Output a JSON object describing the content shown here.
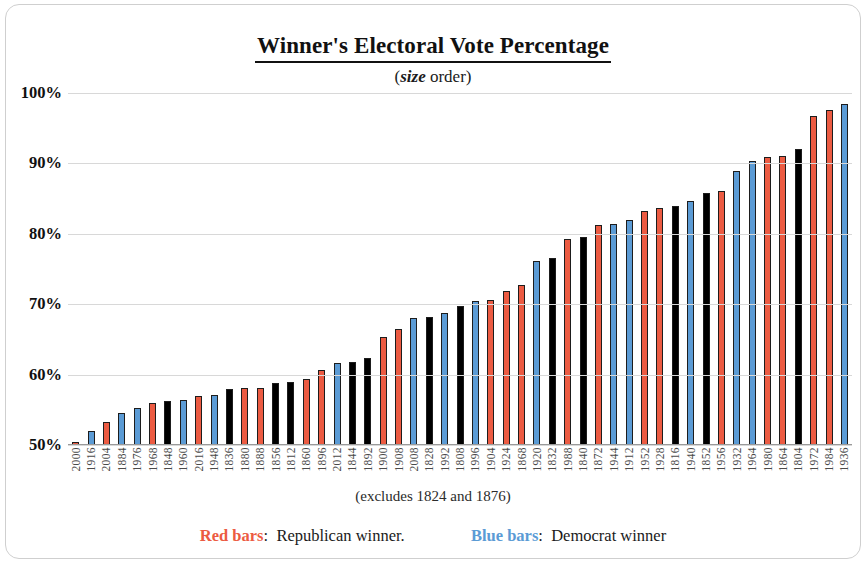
{
  "chart_data": {
    "type": "bar",
    "title": "Winner's Electoral Vote Percentage",
    "subtitle_emphasis": "size",
    "subtitle_prefix": "(",
    "subtitle_suffix": " order)",
    "footnote": "(excludes 1824 and 1876)",
    "xlabel": "",
    "ylabel": "",
    "ylim": [
      50,
      100
    ],
    "yticks": [
      "50%",
      "60%",
      "70%",
      "80%",
      "90%",
      "100%"
    ],
    "ytick_values": [
      50,
      60,
      70,
      80,
      90,
      100
    ],
    "grid": true,
    "legend_position": "bottom",
    "categories": [
      "2000",
      "1916",
      "2004",
      "1884",
      "1976",
      "1968",
      "1848",
      "1960",
      "2016",
      "1948",
      "1836",
      "1880",
      "1888",
      "1856",
      "1812",
      "1860",
      "1896",
      "2012",
      "1844",
      "1892",
      "1900",
      "1908",
      "2008",
      "1828",
      "1992",
      "1808",
      "1996",
      "1904",
      "1924",
      "1868",
      "1920",
      "1832",
      "1988",
      "1840",
      "1872",
      "1944",
      "1912",
      "1952",
      "1928",
      "1816",
      "1940",
      "1852",
      "1956",
      "1932",
      "1964",
      "1980",
      "1864",
      "1804",
      "1972",
      "1984",
      "1936"
    ],
    "values": [
      50.4,
      52.0,
      53.2,
      54.6,
      55.2,
      55.9,
      56.2,
      56.4,
      56.9,
      57.1,
      58.0,
      58.1,
      58.1,
      58.8,
      59.0,
      59.4,
      60.6,
      61.7,
      61.8,
      62.4,
      65.3,
      66.5,
      68.0,
      68.2,
      68.8,
      69.7,
      70.4,
      70.6,
      71.9,
      72.8,
      76.1,
      76.6,
      79.2,
      79.6,
      81.3,
      81.4,
      81.9,
      83.2,
      83.6,
      84.0,
      84.6,
      85.8,
      86.1,
      88.9,
      90.3,
      90.9,
      91.0,
      92.0,
      96.7,
      97.6,
      98.5
    ],
    "bar_party": [
      "rep",
      "dem",
      "rep",
      "dem",
      "dem",
      "rep",
      "oth",
      "dem",
      "rep",
      "dem",
      "oth",
      "rep",
      "rep",
      "oth",
      "oth",
      "rep",
      "rep",
      "dem",
      "oth",
      "oth",
      "rep",
      "rep",
      "dem",
      "oth",
      "dem",
      "oth",
      "dem",
      "rep",
      "rep",
      "rep",
      "dem",
      "oth",
      "rep",
      "oth",
      "rep",
      "dem",
      "dem",
      "rep",
      "rep",
      "oth",
      "dem",
      "oth",
      "rep",
      "dem",
      "dem",
      "rep",
      "rep",
      "oth",
      "rep",
      "rep",
      "dem"
    ],
    "series": [
      {
        "name": "Republican winner",
        "color": "#ec5b42"
      },
      {
        "name": "Democrat winner",
        "color": "#5b9bd5"
      },
      {
        "name": "Other / pre-party winner",
        "color": "#000000"
      }
    ]
  },
  "legend": {
    "red_key": "Red bars",
    "red_sep": ":",
    "red_text": "Republican winner.",
    "blue_key": "Blue bars",
    "blue_sep": ":",
    "blue_text": "Democrat winner"
  }
}
